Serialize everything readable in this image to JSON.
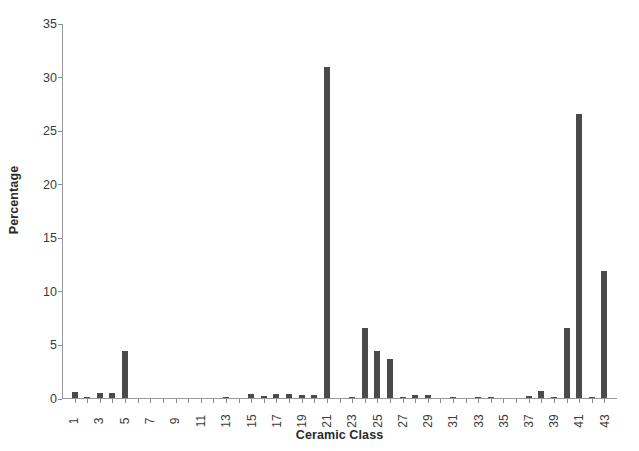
{
  "chart_data": {
    "type": "bar",
    "title": "",
    "subtitle": "",
    "xlabel": "Ceramic Class",
    "ylabel": "Percentage",
    "xlim": [
      0,
      44
    ],
    "ylim": [
      0,
      35
    ],
    "ytick_step": 5,
    "ytick_labels": [
      "0",
      "5",
      "10",
      "15",
      "20",
      "25",
      "30",
      "35"
    ],
    "xtick_labels": [
      "1",
      "3",
      "5",
      "7",
      "9",
      "11",
      "13",
      "15",
      "17",
      "19",
      "21",
      "23",
      "25",
      "27",
      "29",
      "31",
      "33",
      "35",
      "37",
      "39",
      "41",
      "43"
    ],
    "grid": false,
    "legend": false,
    "bar_color": "#4a4a4a",
    "axis_color": "#9a9a9a",
    "categories": [
      1,
      2,
      3,
      4,
      5,
      6,
      7,
      8,
      9,
      10,
      11,
      12,
      13,
      14,
      15,
      16,
      17,
      18,
      19,
      20,
      21,
      22,
      23,
      24,
      25,
      26,
      27,
      28,
      29,
      30,
      31,
      32,
      33,
      34,
      35,
      36,
      37,
      38,
      39,
      40,
      41,
      42,
      43
    ],
    "values": [
      0.6,
      0.1,
      0.5,
      0.5,
      4.4,
      0.0,
      0.0,
      0.0,
      0.0,
      0.0,
      0.0,
      0.0,
      0.1,
      0.0,
      0.4,
      0.2,
      0.4,
      0.4,
      0.3,
      0.3,
      30.9,
      0.0,
      0.1,
      6.5,
      4.4,
      3.6,
      0.1,
      0.3,
      0.3,
      0.0,
      0.1,
      0.0,
      0.1,
      0.1,
      0.0,
      0.0,
      0.2,
      0.7,
      0.1,
      6.5,
      26.5,
      0.1,
      11.9
    ]
  },
  "axis": {
    "y_title": "Percentage",
    "x_title": "Ceramic Class"
  }
}
